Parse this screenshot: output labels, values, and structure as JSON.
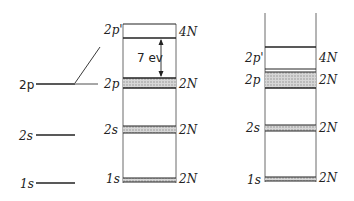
{
  "diagram": {
    "type": "energy-level-diagram",
    "colors": {
      "line": "#222222",
      "band_fill": "#c8c8c8"
    },
    "atomic_levels": [
      {
        "label": "2p",
        "y": 84
      },
      {
        "label": "2s",
        "y": 135
      },
      {
        "label": "1s",
        "y": 183
      }
    ],
    "middle_panel": {
      "levels": [
        {
          "label": "2p'",
          "capacity": "4N"
        },
        {
          "label": "2p",
          "capacity": "2N"
        },
        {
          "label": "2s",
          "capacity": "2N"
        },
        {
          "label": "1s",
          "capacity": "2N"
        }
      ],
      "gap_annotation": "7 ev"
    },
    "right_panel": {
      "levels": [
        {
          "label": "2p'",
          "capacity": "4N"
        },
        {
          "label": "2p",
          "capacity": "2N"
        },
        {
          "label": "2s",
          "capacity": "2N"
        },
        {
          "label": "1s",
          "capacity": "2N"
        }
      ]
    }
  }
}
